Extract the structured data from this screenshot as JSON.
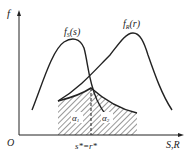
{
  "diagram": {
    "type": "stress-strength interference",
    "axis_y_label": "f",
    "axis_x_label": "S,R",
    "origin_label": "O",
    "curve_stress": {
      "label_main": "f",
      "label_sub": "S",
      "label_arg": "(s)"
    },
    "curve_strength": {
      "label_main": "f",
      "label_sub": "R",
      "label_arg": "(r)"
    },
    "intersection_label": "s*=r*",
    "region_left_label": "α",
    "region_left_sub": "1",
    "region_right_label": "α",
    "region_right_sub": "2",
    "colors": {
      "line": "#222222",
      "hatch": "#333333",
      "background": "#ffffff"
    }
  }
}
